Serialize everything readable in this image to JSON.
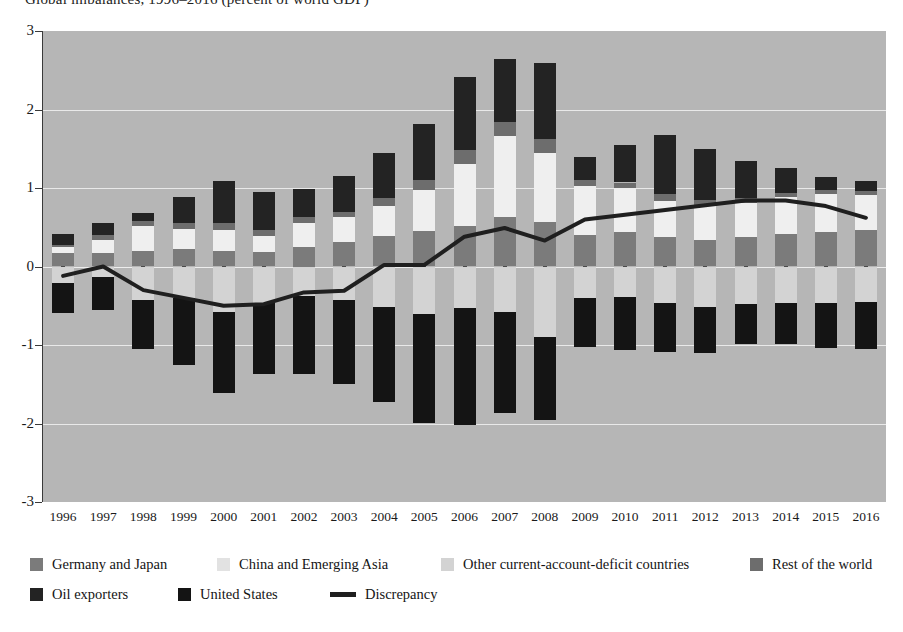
{
  "title_fragment": "Global imbalances, 1996–2016 (percent of world GDP)",
  "axis": {
    "y_ticks": [
      "3",
      "2",
      "1",
      "0",
      "-1",
      "-2",
      "-3"
    ],
    "y_min": -3,
    "y_max": 3,
    "x_labels": [
      "1996",
      "1997",
      "1998",
      "1999",
      "2000",
      "2001",
      "2002",
      "2003",
      "2004",
      "2005",
      "2006",
      "2007",
      "2008",
      "2009",
      "2010",
      "2011",
      "2012",
      "2013",
      "2014",
      "2015",
      "2016"
    ]
  },
  "legend": {
    "row1": [
      {
        "label": "Germany and Japan",
        "color": "#7b7b7b",
        "type": "swatch",
        "x": 30
      },
      {
        "label": "China and Emerging Asia",
        "color": "#e2e2e2",
        "type": "swatch",
        "x": 217
      },
      {
        "label": "Other current-account-deficit countries",
        "color": "#d3d3d3",
        "type": "swatch",
        "x": 441
      },
      {
        "label": "Rest of the world",
        "color": "#6d6d6d",
        "type": "swatch",
        "x": 750
      }
    ],
    "row2": [
      {
        "label": "Oil exporters",
        "color": "#232323",
        "type": "swatch",
        "x": 30
      },
      {
        "label": "United States",
        "color": "#141414",
        "type": "swatch",
        "x": 178
      },
      {
        "label": "Discrepancy",
        "color": "#1f1f1f",
        "type": "line",
        "x": 330
      }
    ]
  },
  "colors": {
    "plot_background": "#b6b6b6",
    "gridline": "#e9e9e9",
    "germany_japan": "#7b7b7b",
    "china_emerging_asia": "#efefef",
    "other_deficit": "#d3d3d3",
    "rest_of_world": "#6d6d6d",
    "oil_exporters": "#232323",
    "united_states": "#141414",
    "discrepancy_line": "#1f1f1f",
    "axis": "#3a3a3a"
  },
  "chart_data": {
    "type": "bar",
    "title": "Global imbalances, 1996–2016 (percent of world GDP)",
    "subtype": "stacked-bar-diverging-with-line-overlay",
    "xlabel": "",
    "ylabel": "",
    "ylim": [
      -3,
      3
    ],
    "grid": true,
    "legend_position": "bottom",
    "categories": [
      "1996",
      "1997",
      "1998",
      "1999",
      "2000",
      "2001",
      "2002",
      "2003",
      "2004",
      "2005",
      "2006",
      "2007",
      "2008",
      "2009",
      "2010",
      "2011",
      "2012",
      "2013",
      "2014",
      "2015",
      "2016"
    ],
    "series": [
      {
        "name": "Germany and Japan",
        "color": "#7b7b7b",
        "stack": "positive",
        "values": [
          0.17,
          0.17,
          0.2,
          0.22,
          0.2,
          0.19,
          0.25,
          0.31,
          0.39,
          0.45,
          0.52,
          0.63,
          0.57,
          0.4,
          0.44,
          0.37,
          0.34,
          0.38,
          0.42,
          0.44,
          0.47
        ]
      },
      {
        "name": "China and Emerging Asia",
        "color": "#efefef",
        "stack": "positive",
        "values": [
          0.08,
          0.17,
          0.32,
          0.26,
          0.26,
          0.2,
          0.3,
          0.32,
          0.38,
          0.52,
          0.79,
          1.03,
          0.88,
          0.63,
          0.56,
          0.47,
          0.44,
          0.43,
          0.47,
          0.48,
          0.44
        ]
      },
      {
        "name": "Rest of the world",
        "color": "#6d6d6d",
        "stack": "positive",
        "values": [
          0.03,
          0.06,
          0.06,
          0.07,
          0.1,
          0.07,
          0.08,
          0.07,
          0.1,
          0.13,
          0.17,
          0.18,
          0.18,
          0.07,
          0.07,
          0.08,
          0.07,
          0.06,
          0.05,
          0.05,
          0.05
        ]
      },
      {
        "name": "Oil exporters",
        "color": "#232323",
        "stack": "positive",
        "values": [
          0.14,
          0.15,
          0.1,
          0.33,
          0.53,
          0.49,
          0.36,
          0.45,
          0.57,
          0.72,
          0.94,
          0.8,
          0.96,
          0.3,
          0.48,
          0.75,
          0.65,
          0.47,
          0.31,
          0.17,
          0.13
        ]
      },
      {
        "name": "United States",
        "color": "#141414",
        "stack": "negative",
        "values": [
          -0.38,
          -0.41,
          -0.62,
          -0.86,
          -1.03,
          -0.9,
          -0.99,
          -1.07,
          -1.21,
          -1.4,
          -1.49,
          -1.29,
          -1.05,
          -0.62,
          -0.67,
          -0.62,
          -0.59,
          -0.51,
          -0.52,
          -0.57,
          -0.6
        ]
      },
      {
        "name": "Other current-account-deficit countries",
        "color": "#d3d3d3",
        "stack": "negative",
        "values": [
          -0.21,
          -0.14,
          -0.43,
          -0.4,
          -0.58,
          -0.47,
          -0.38,
          -0.43,
          -0.51,
          -0.6,
          -0.53,
          -0.58,
          -0.9,
          -0.4,
          -0.39,
          -0.47,
          -0.51,
          -0.48,
          -0.47,
          -0.47,
          -0.45
        ]
      },
      {
        "name": "Discrepancy",
        "color": "#1f1f1f",
        "type": "line",
        "values": [
          -0.12,
          0.0,
          -0.3,
          -0.4,
          -0.5,
          -0.48,
          -0.33,
          -0.31,
          0.02,
          0.02,
          0.38,
          0.49,
          0.33,
          0.6,
          0.66,
          0.72,
          0.78,
          0.84,
          0.84,
          0.77,
          0.62
        ]
      }
    ]
  }
}
